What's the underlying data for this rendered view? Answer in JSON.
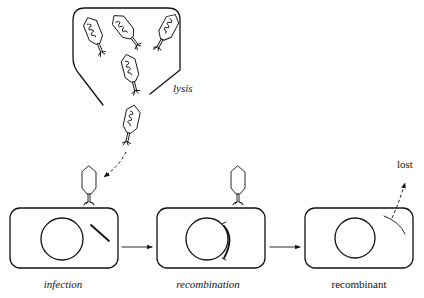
{
  "diagram": {
    "lysis_label": "lysis",
    "lost_label": "lost",
    "stages": [
      {
        "label": "infection",
        "italic": true
      },
      {
        "label": "recombination",
        "italic": true
      },
      {
        "label": "recombinant",
        "italic": false
      }
    ],
    "colors": {
      "ink": "#111111",
      "background": "#ffffff"
    }
  }
}
